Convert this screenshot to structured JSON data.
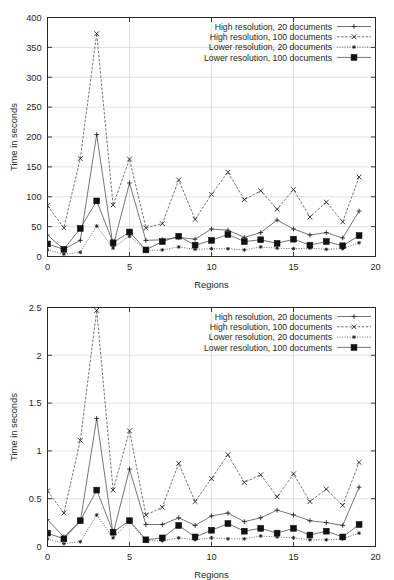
{
  "figures": [
    {
      "id": "top",
      "chart_ref": 0
    },
    {
      "id": "bottom",
      "chart_ref": 1
    }
  ],
  "legend_markers": [
    "plus",
    "cross",
    "star",
    "square"
  ],
  "chart_data": [
    {
      "type": "line",
      "title": "",
      "xlabel": "Regions",
      "ylabel": "Time in seconds",
      "xlim": [
        0,
        20
      ],
      "ylim": [
        0,
        400
      ],
      "xticks": [
        0,
        5,
        10,
        15,
        20
      ],
      "xtick_labels": [
        "0",
        "5",
        "10",
        "15",
        "20"
      ],
      "yticks": [
        0,
        50,
        100,
        150,
        200,
        250,
        300,
        350,
        400
      ],
      "ytick_labels": [
        "0",
        "50",
        "100",
        "150",
        "200",
        "250",
        "300",
        "350",
        "400"
      ],
      "grid": true,
      "legend_position": "top-right-inside",
      "x": [
        0,
        1,
        2,
        3,
        4,
        5,
        6,
        7,
        8,
        9,
        10,
        11,
        12,
        13,
        14,
        15,
        16,
        17,
        18,
        19
      ],
      "series": [
        {
          "name": "High resolution, 20 documents",
          "marker": "plus",
          "linestyle": "solid",
          "values": [
            36,
            12,
            27,
            204,
            17,
            123,
            27,
            28,
            32,
            29,
            46,
            44,
            32,
            40,
            61,
            46,
            36,
            40,
            31,
            76
          ]
        },
        {
          "name": "High resolution, 100 documents",
          "marker": "cross",
          "linestyle": "dashdot",
          "values": [
            85,
            48,
            164,
            373,
            86,
            163,
            48,
            55,
            128,
            62,
            104,
            141,
            95,
            110,
            79,
            112,
            66,
            91,
            58,
            133
          ]
        },
        {
          "name": "Lower resolution, 20 documents",
          "marker": "star",
          "linestyle": "dotted",
          "values": [
            11,
            4,
            7,
            51,
            14,
            34,
            10,
            11,
            16,
            12,
            13,
            13,
            11,
            16,
            14,
            13,
            14,
            12,
            13,
            23
          ]
        },
        {
          "name": "Lower resolution, 100 documents",
          "marker": "square",
          "linestyle": "solid",
          "values": [
            21,
            12,
            47,
            93,
            23,
            41,
            11,
            25,
            34,
            19,
            27,
            37,
            25,
            28,
            22,
            29,
            19,
            25,
            18,
            35
          ]
        }
      ]
    },
    {
      "type": "line",
      "title": "",
      "xlabel": "Regions",
      "ylabel": "Time in seconds",
      "xlim": [
        0,
        20
      ],
      "ylim": [
        0,
        2.5
      ],
      "xticks": [
        0,
        5,
        10,
        15,
        20
      ],
      "xtick_labels": [
        "0",
        "5",
        "10",
        "15",
        "20"
      ],
      "yticks": [
        0,
        0.5,
        1,
        1.5,
        2,
        2.5
      ],
      "ytick_labels": [
        "0",
        "0.5",
        "1",
        "1.5",
        "2",
        "2.5"
      ],
      "grid": true,
      "legend_position": "top-right-inside",
      "x": [
        0,
        1,
        2,
        3,
        4,
        5,
        6,
        7,
        8,
        9,
        10,
        11,
        12,
        13,
        14,
        15,
        16,
        17,
        18,
        19
      ],
      "series": [
        {
          "name": "High resolution, 20 documents",
          "marker": "plus",
          "linestyle": "solid",
          "values": [
            0.28,
            0.1,
            0.26,
            1.34,
            0.13,
            0.81,
            0.23,
            0.23,
            0.3,
            0.22,
            0.32,
            0.35,
            0.26,
            0.3,
            0.38,
            0.33,
            0.27,
            0.25,
            0.22,
            0.62
          ]
        },
        {
          "name": "High resolution, 100 documents",
          "marker": "cross",
          "linestyle": "dashdot",
          "values": [
            0.58,
            0.35,
            1.11,
            2.47,
            0.59,
            1.21,
            0.33,
            0.41,
            0.87,
            0.47,
            0.71,
            0.96,
            0.67,
            0.75,
            0.52,
            0.76,
            0.47,
            0.6,
            0.43,
            0.88
          ]
        },
        {
          "name": "Lower resolution, 20 documents",
          "marker": "star",
          "linestyle": "dotted",
          "values": [
            0.08,
            0.03,
            0.05,
            0.33,
            0.09,
            0.26,
            0.06,
            0.06,
            0.09,
            0.07,
            0.09,
            0.08,
            0.08,
            0.11,
            0.1,
            0.09,
            0.07,
            0.07,
            0.08,
            0.14
          ]
        },
        {
          "name": "Lower resolution, 100 documents",
          "marker": "square",
          "linestyle": "solid",
          "values": [
            0.14,
            0.08,
            0.27,
            0.59,
            0.15,
            0.27,
            0.07,
            0.09,
            0.22,
            0.1,
            0.17,
            0.24,
            0.16,
            0.19,
            0.14,
            0.19,
            0.12,
            0.16,
            0.1,
            0.23
          ]
        }
      ]
    }
  ]
}
